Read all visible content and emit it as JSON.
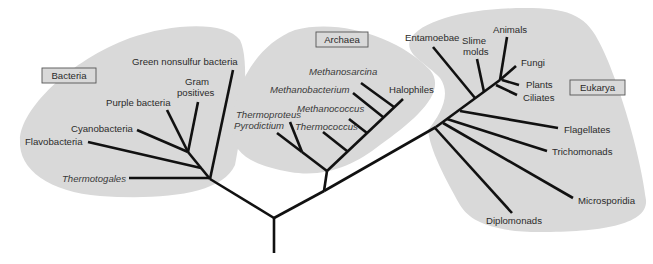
{
  "diagram": {
    "colors": {
      "blob": "#d9d9d9",
      "branch": "#111111",
      "text": "#2b2b2b",
      "box_border": "#555555"
    },
    "domains": [
      {
        "id": "bacteria",
        "label": "Bacteria",
        "box": [
          42,
          68,
          54,
          15
        ],
        "blob": "M 20 140 C 20 110, 70 60, 130 38 C 170 24, 225 20, 240 40 C 250 60, 244 120, 235 165 C 222 195, 160 200, 100 196 C 50 192, 18 170, 20 140 Z"
      },
      {
        "id": "archaea",
        "label": "Archaea",
        "box": [
          316,
          32,
          52,
          15
        ],
        "blob": "M 232 130 C 232 90, 255 45, 295 30 C 340 18, 400 38, 430 70 C 448 92, 415 120, 380 145 C 355 165, 325 178, 290 172 C 255 166, 232 155, 232 130 Z"
      },
      {
        "id": "eukarya",
        "label": "Eukarya",
        "box": [
          570,
          80,
          55,
          15
        ],
        "blob": "M 410 40 C 420 20, 470 8, 525 8 C 565 8, 585 14, 598 40 C 615 70, 640 150, 646 200 C 648 225, 600 232, 540 232 C 495 232, 470 222, 460 205 C 445 178, 430 150, 428 130 C 440 115, 452 95, 440 78 C 425 62, 405 55, 410 40 Z"
      }
    ],
    "branches": [
      {
        "group": "root",
        "name": "root-stem",
        "pts": [
          274,
          253,
          274,
          218
        ]
      },
      {
        "group": "root",
        "name": "root-to-bacteria",
        "pts": [
          274,
          218,
          210,
          179
        ]
      },
      {
        "group": "root",
        "name": "root-to-archaea-eukarya",
        "pts": [
          274,
          218,
          324,
          191
        ]
      },
      {
        "group": "root",
        "name": "archaea-eukarya-to-eukarya",
        "pts": [
          324,
          191,
          436,
          127
        ]
      },
      {
        "group": "root",
        "name": "archaea-stem",
        "pts": [
          324,
          191,
          327,
          171
        ]
      },
      {
        "group": "bacteria",
        "name": "green-nonsulfur-branch",
        "pts": [
          210,
          179,
          233,
          70
        ]
      },
      {
        "group": "bacteria",
        "name": "thermotogales-branch",
        "pts": [
          210,
          178,
          129,
          178
        ]
      },
      {
        "group": "bacteria",
        "name": "bacteria-inner-trunk",
        "pts": [
          210,
          179,
          188,
          152
        ]
      },
      {
        "group": "bacteria",
        "name": "flavobacteria-branch",
        "pts": [
          201,
          168,
          88,
          142
        ]
      },
      {
        "group": "bacteria",
        "name": "cyanobacteria-branch",
        "pts": [
          188,
          152,
          137,
          130
        ]
      },
      {
        "group": "bacteria",
        "name": "purple-bacteria-branch",
        "pts": [
          188,
          152,
          167,
          110
        ]
      },
      {
        "group": "bacteria",
        "name": "gram-positives-branch",
        "pts": [
          188,
          152,
          198,
          102
        ]
      },
      {
        "group": "archaea",
        "name": "archaea-main-trunk",
        "pts": [
          327,
          171,
          403,
          99
        ]
      },
      {
        "group": "archaea",
        "name": "crenarchaea-branch",
        "pts": [
          327,
          171,
          302,
          152
        ]
      },
      {
        "group": "archaea",
        "name": "pyrodictium-branch",
        "pts": [
          302,
          152,
          277,
          133
        ]
      },
      {
        "group": "archaea",
        "name": "thermoproteus-branch",
        "pts": [
          302,
          152,
          290,
          122
        ]
      },
      {
        "group": "archaea",
        "name": "thermococcus-branch",
        "pts": [
          347,
          151,
          323,
          132
        ]
      },
      {
        "group": "archaea",
        "name": "methanococcus-branch",
        "pts": [
          367,
          133,
          349,
          119
        ]
      },
      {
        "group": "archaea",
        "name": "methanobacterium-branch",
        "pts": [
          383,
          117,
          353,
          93
        ]
      },
      {
        "group": "archaea",
        "name": "methanosarcina-branch",
        "pts": [
          394,
          107,
          361,
          83
        ]
      },
      {
        "group": "eukarya",
        "name": "eukarya-main-trunk",
        "pts": [
          436,
          127,
          500,
          80
        ]
      },
      {
        "group": "eukarya",
        "name": "entamoebae-branch",
        "pts": [
          475,
          98,
          433,
          47
        ]
      },
      {
        "group": "eukarya",
        "name": "slime-molds-branch",
        "pts": [
          484,
          92,
          477,
          59
        ]
      },
      {
        "group": "eukarya",
        "name": "animals-branch",
        "pts": [
          500,
          80,
          507,
          37
        ]
      },
      {
        "group": "eukarya",
        "name": "fungi-branch",
        "pts": [
          500,
          80,
          516,
          66
        ]
      },
      {
        "group": "eukarya",
        "name": "plants-branch",
        "pts": [
          502,
          80,
          519,
          85
        ]
      },
      {
        "group": "eukarya",
        "name": "ciliates-branch",
        "pts": [
          496,
          85,
          517,
          95
        ]
      },
      {
        "group": "eukarya",
        "name": "flagellates-branch",
        "pts": [
          460,
          111,
          558,
          128
        ]
      },
      {
        "group": "eukarya",
        "name": "trichomonads-branch",
        "pts": [
          447,
          119,
          547,
          151
        ]
      },
      {
        "group": "eukarya",
        "name": "microsporidia-branch",
        "pts": [
          443,
          123,
          573,
          198
        ]
      },
      {
        "group": "eukarya",
        "name": "diplomonads-branch",
        "pts": [
          435,
          128,
          512,
          213
        ]
      }
    ],
    "labels": [
      {
        "domain": "bacteria",
        "text": "Green nonsulfur bacteria",
        "x": 132,
        "y": 65,
        "italic": false
      },
      {
        "domain": "bacteria",
        "text": "Gram",
        "x": 185,
        "y": 85,
        "italic": false
      },
      {
        "domain": "bacteria",
        "text": "positives",
        "x": 177,
        "y": 96,
        "italic": false
      },
      {
        "domain": "bacteria",
        "text": "Purple bacteria",
        "x": 106,
        "y": 106,
        "italic": false
      },
      {
        "domain": "bacteria",
        "text": "Cyanobacteria",
        "x": 71,
        "y": 132,
        "italic": false
      },
      {
        "domain": "bacteria",
        "text": "Flavobacteria",
        "x": 25,
        "y": 145,
        "italic": false
      },
      {
        "domain": "bacteria",
        "text": "Thermotogales",
        "x": 62,
        "y": 182,
        "italic": true
      },
      {
        "domain": "archaea",
        "text": "Methanosarcina",
        "x": 309,
        "y": 75,
        "italic": true
      },
      {
        "domain": "archaea",
        "text": "Methanobacterium",
        "x": 270,
        "y": 93,
        "italic": true
      },
      {
        "domain": "archaea",
        "text": "Halophiles",
        "x": 389,
        "y": 93,
        "italic": false
      },
      {
        "domain": "archaea",
        "text": "Methanococcus",
        "x": 297,
        "y": 112,
        "italic": true
      },
      {
        "domain": "archaea",
        "text": "Thermoproteus",
        "x": 236,
        "y": 118,
        "italic": true
      },
      {
        "domain": "archaea",
        "text": "Pyrodictium",
        "x": 234,
        "y": 129,
        "italic": true
      },
      {
        "domain": "archaea",
        "text": "Thermococcus",
        "x": 295,
        "y": 130,
        "italic": true
      },
      {
        "domain": "eukarya",
        "text": "Animals",
        "x": 493,
        "y": 33,
        "italic": false
      },
      {
        "domain": "eukarya",
        "text": "Entamoebae",
        "x": 405,
        "y": 41,
        "italic": false
      },
      {
        "domain": "eukarya",
        "text": "Slime",
        "x": 462,
        "y": 44,
        "italic": false
      },
      {
        "domain": "eukarya",
        "text": "molds",
        "x": 463,
        "y": 55,
        "italic": false
      },
      {
        "domain": "eukarya",
        "text": "Fungi",
        "x": 521,
        "y": 66,
        "italic": false
      },
      {
        "domain": "eukarya",
        "text": "Plants",
        "x": 526,
        "y": 88,
        "italic": false
      },
      {
        "domain": "eukarya",
        "text": "Ciliates",
        "x": 523,
        "y": 101,
        "italic": false
      },
      {
        "domain": "eukarya",
        "text": "Flagellates",
        "x": 564,
        "y": 133,
        "italic": false
      },
      {
        "domain": "eukarya",
        "text": "Trichomonads",
        "x": 552,
        "y": 155,
        "italic": false
      },
      {
        "domain": "eukarya",
        "text": "Microsporidia",
        "x": 578,
        "y": 204,
        "italic": false
      },
      {
        "domain": "eukarya",
        "text": "Diplomonads",
        "x": 486,
        "y": 224,
        "italic": false
      }
    ]
  }
}
